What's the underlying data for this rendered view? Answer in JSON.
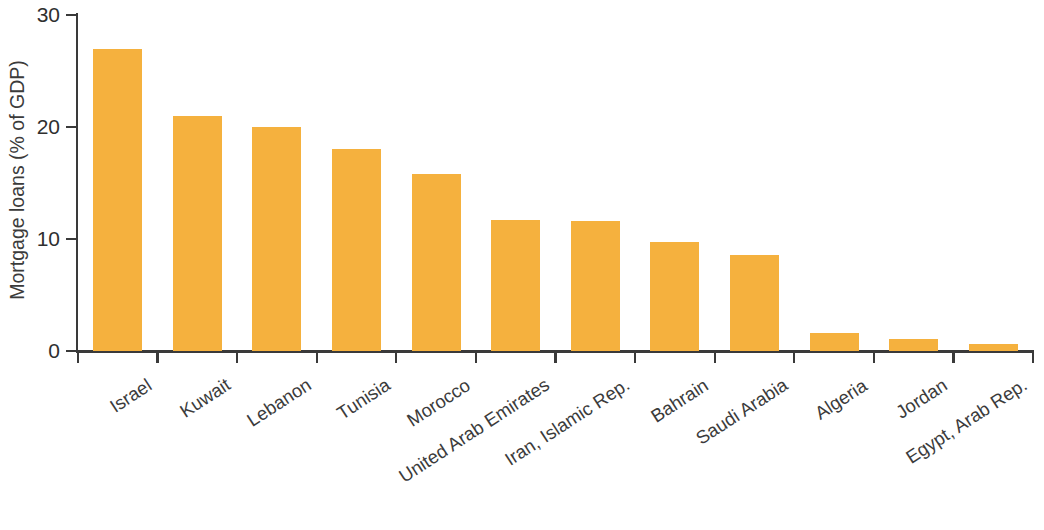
{
  "chart_data": {
    "type": "bar",
    "title": "",
    "subtitle": "",
    "xlabel": "",
    "ylabel": "Mortgage loans (% of GDP)",
    "categories": [
      "Israel",
      "Kuwait",
      "Lebanon",
      "Tunisia",
      "Morocco",
      "United Arab Emirates",
      "Iran, Islamic Rep.",
      "Bahrain",
      "Saudi Arabia",
      "Algeria",
      "Jordan",
      "Egypt, Arab Rep."
    ],
    "values": [
      27,
      21,
      20,
      18,
      15.8,
      11.7,
      11.6,
      9.7,
      8.6,
      1.6,
      1.1,
      0.6
    ],
    "ylim": [
      0,
      30
    ],
    "yticks": [
      0,
      10,
      20,
      30
    ],
    "ytick_labels": [
      "0",
      "10",
      "20",
      "30"
    ],
    "grid": false,
    "legend": false,
    "legend_position": "none",
    "bar_color": "#f5b13e",
    "axis_color": "#3a3a3a",
    "text_color": "#3b3b3b",
    "background": "#ffffff",
    "annotations": []
  }
}
